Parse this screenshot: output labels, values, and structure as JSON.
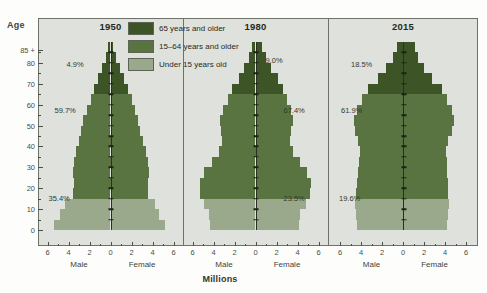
{
  "figure": {
    "y_axis_title": "Age",
    "x_axis_title": "Millions",
    "male_label": "Male",
    "female_label": "Female",
    "y_ticks": [
      "0",
      "10",
      "20",
      "30",
      "40",
      "50",
      "60",
      "70",
      "80",
      "85 +"
    ],
    "x_ticks": [
      "6",
      "4",
      "2",
      "0",
      "2",
      "4",
      "6"
    ]
  },
  "legend": {
    "items": [
      {
        "label": "65 years and older",
        "color": "#3c5426"
      },
      {
        "label": "15–64 years and older",
        "color": "#5a7441"
      },
      {
        "label": "Under 15 years old",
        "color": "#9aa88c"
      }
    ]
  },
  "colors": {
    "older": "#3c5426",
    "working": "#5a7441",
    "young": "#9aa88c",
    "panel_bg": "#dfe1dc",
    "frame": "#6d7168",
    "text": "#2f3a2c"
  },
  "chart_data": {
    "type": "bar",
    "subtype": "population-pyramid",
    "title": "",
    "xlabel": "Millions",
    "ylabel": "Age",
    "xlim": [
      -6,
      6
    ],
    "ylim": [
      0,
      90
    ],
    "grid": false,
    "legend_position": "top-center",
    "age_groups": [
      "0-4",
      "5-9",
      "10-14",
      "15-19",
      "20-24",
      "25-29",
      "30-34",
      "35-39",
      "40-44",
      "45-49",
      "50-54",
      "55-59",
      "60-64",
      "65-69",
      "70-74",
      "75-79",
      "80-84",
      "85+"
    ],
    "panels": [
      {
        "year": "1950",
        "annotations": [
          {
            "text": "4.9%",
            "group": "65 years and older"
          },
          {
            "text": "59.7%",
            "group": "15–64 years and older"
          },
          {
            "text": "35.4%",
            "group": "Under 15 years old"
          }
        ],
        "male": [
          5.4,
          4.8,
          4.3,
          3.6,
          3.5,
          3.6,
          3.5,
          3.3,
          3.0,
          2.8,
          2.6,
          2.2,
          1.9,
          1.6,
          1.2,
          0.8,
          0.4,
          0.2
        ],
        "female": [
          5.2,
          4.6,
          4.2,
          3.6,
          3.6,
          3.7,
          3.6,
          3.4,
          3.1,
          2.8,
          2.6,
          2.3,
          2.0,
          1.7,
          1.3,
          0.9,
          0.5,
          0.2
        ]
      },
      {
        "year": "1980",
        "annotations": [
          {
            "text": "9.0%",
            "group": "65 years and older"
          },
          {
            "text": "67.4%",
            "group": "15–64 years and older"
          },
          {
            "text": "23.5%",
            "group": "Under 15 years old"
          }
        ],
        "male": [
          4.3,
          4.4,
          4.9,
          5.3,
          5.3,
          4.9,
          4.1,
          3.5,
          3.2,
          3.3,
          3.4,
          3.1,
          2.6,
          2.2,
          1.6,
          1.1,
          0.6,
          0.3
        ],
        "female": [
          4.1,
          4.2,
          4.8,
          5.2,
          5.3,
          4.9,
          4.2,
          3.6,
          3.3,
          3.4,
          3.6,
          3.4,
          3.0,
          2.6,
          2.1,
          1.5,
          1.0,
          0.6
        ]
      },
      {
        "year": "2015",
        "annotations": [
          {
            "text": "18.5%",
            "group": "65 years and older"
          },
          {
            "text": "61.9%",
            "group": "15–64 years and older"
          },
          {
            "text": "19.6%",
            "group": "Under 15 years old"
          }
        ],
        "male": [
          4.4,
          4.5,
          4.6,
          4.5,
          4.4,
          4.3,
          4.2,
          4.1,
          4.3,
          4.6,
          4.7,
          4.4,
          3.9,
          3.3,
          2.4,
          1.6,
          1.0,
          0.6
        ],
        "female": [
          4.2,
          4.3,
          4.4,
          4.3,
          4.3,
          4.2,
          4.2,
          4.1,
          4.3,
          4.7,
          4.9,
          4.7,
          4.2,
          3.7,
          2.8,
          2.0,
          1.4,
          1.1
        ]
      }
    ]
  }
}
